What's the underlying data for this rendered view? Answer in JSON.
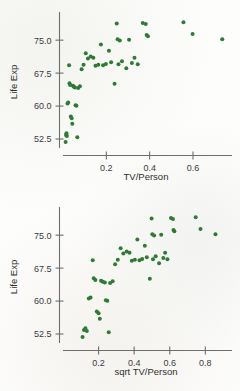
{
  "figure": {
    "background_color": "#fdfdfc",
    "marker_color": "#2f7a35",
    "axis_color": "#6e6e6e",
    "text_color": "#2f2f2f"
  },
  "chart_data": [
    {
      "type": "scatter",
      "title": "",
      "xlabel": "TV/Person",
      "ylabel": "Life Exp",
      "xlim": [
        0.0,
        0.78
      ],
      "ylim": [
        50.0,
        80.5
      ],
      "xticks": [
        "0.2",
        "0.4",
        "0.6"
      ],
      "xtick_values": [
        0.2,
        0.4,
        0.6
      ],
      "yticks": [
        "52.5",
        "60.0",
        "67.5",
        "75.0"
      ],
      "ytick_values": [
        52.5,
        60.0,
        67.5,
        75.0
      ],
      "grid": false,
      "legend": "none",
      "marker": "filled-circle",
      "x": [
        0.012,
        0.014,
        0.016,
        0.018,
        0.021,
        0.024,
        0.028,
        0.03,
        0.033,
        0.036,
        0.04,
        0.043,
        0.046,
        0.05,
        0.055,
        0.058,
        0.062,
        0.066,
        0.07,
        0.078,
        0.086,
        0.095,
        0.105,
        0.115,
        0.128,
        0.14,
        0.15,
        0.163,
        0.175,
        0.185,
        0.198,
        0.212,
        0.222,
        0.238,
        0.248,
        0.252,
        0.256,
        0.262,
        0.272,
        0.292,
        0.305,
        0.318,
        0.33,
        0.345,
        0.368,
        0.382,
        0.386,
        0.392,
        0.556,
        0.598,
        0.735
      ],
      "y": [
        51.8,
        53.4,
        53.8,
        53.2,
        60.6,
        60.8,
        69.3,
        65.2,
        64.8,
        57.6,
        57.2,
        56.0,
        64.6,
        64.4,
        64.2,
        60.2,
        60.1,
        52.9,
        64.1,
        64.5,
        68.4,
        69.4,
        72.0,
        70.8,
        71.3,
        71.0,
        69.2,
        69.4,
        74.0,
        69.3,
        69.6,
        72.6,
        70.0,
        65.1,
        78.8,
        75.2,
        69.5,
        74.9,
        70.2,
        68.6,
        75.1,
        69.8,
        71.0,
        69.5,
        78.9,
        78.7,
        76.2,
        75.9,
        79.1,
        76.4,
        75.2
      ]
    },
    {
      "type": "scatter",
      "title": "",
      "xlabel": "sqrt TV/Person",
      "ylabel": "Life Exp",
      "xlim": [
        0.0,
        0.95
      ],
      "ylim": [
        50.0,
        80.5
      ],
      "xticks": [
        "0.2",
        "0.4",
        "0.6",
        "0.8"
      ],
      "xtick_values": [
        0.2,
        0.4,
        0.6,
        0.8
      ],
      "yticks": [
        "52.5",
        "60.0",
        "67.5",
        "75.0"
      ],
      "ytick_values": [
        52.5,
        60.0,
        67.5,
        75.0
      ],
      "grid": false,
      "legend": "none",
      "marker": "filled-circle",
      "x": [
        0.11,
        0.118,
        0.126,
        0.134,
        0.145,
        0.155,
        0.167,
        0.173,
        0.182,
        0.19,
        0.2,
        0.207,
        0.214,
        0.224,
        0.235,
        0.241,
        0.249,
        0.257,
        0.265,
        0.279,
        0.293,
        0.308,
        0.324,
        0.339,
        0.358,
        0.374,
        0.387,
        0.404,
        0.418,
        0.43,
        0.445,
        0.46,
        0.471,
        0.488,
        0.498,
        0.502,
        0.506,
        0.512,
        0.521,
        0.54,
        0.552,
        0.564,
        0.574,
        0.587,
        0.607,
        0.618,
        0.621,
        0.626,
        0.746,
        0.773,
        0.857
      ],
      "y": [
        51.8,
        53.4,
        53.8,
        53.2,
        60.6,
        60.8,
        69.3,
        65.2,
        64.8,
        57.6,
        57.2,
        56.0,
        64.6,
        64.4,
        64.2,
        60.2,
        60.1,
        52.9,
        64.1,
        64.5,
        68.4,
        69.4,
        72.0,
        70.8,
        71.3,
        71.0,
        69.2,
        69.4,
        74.0,
        69.3,
        69.6,
        72.6,
        70.0,
        65.1,
        78.8,
        75.2,
        69.5,
        74.9,
        70.2,
        68.6,
        75.1,
        69.8,
        71.0,
        69.5,
        78.9,
        78.7,
        76.2,
        75.9,
        79.1,
        76.4,
        75.2
      ]
    }
  ]
}
